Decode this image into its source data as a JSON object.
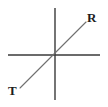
{
  "figure": {
    "kind": "coordinate-axes-diagram",
    "background_color": "#ffffff",
    "width": 108,
    "height": 107,
    "origin": {
      "x": 55,
      "y": 55
    }
  },
  "axes": {
    "color": "#3a3a3a",
    "stroke_width": 1.4,
    "horizontal": {
      "x1": 8,
      "y1": 55,
      "x2": 100,
      "y2": 55
    },
    "vertical": {
      "x1": 55,
      "y1": 8,
      "x2": 55,
      "y2": 100
    }
  },
  "ray": {
    "color": "#6f6f6f",
    "stroke_width": 1.1,
    "start": {
      "x": 20,
      "y": 88
    },
    "end": {
      "x": 86,
      "y": 22
    }
  },
  "labels": {
    "upper_right": {
      "text": "R",
      "color": "#1d1d1d",
      "x": 87,
      "y": 11
    },
    "lower_left": {
      "text": "T",
      "color": "#1d1d1d",
      "x": 8,
      "y": 84
    }
  }
}
